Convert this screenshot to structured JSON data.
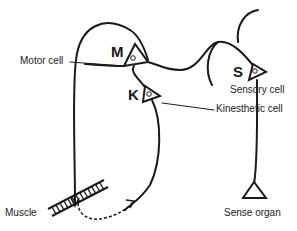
{
  "diagram": {
    "cells": {
      "motor": {
        "letter": "M",
        "label": "Motor cell"
      },
      "kinesthetic": {
        "letter": "K",
        "label": "Kinesthetic cell"
      },
      "sensory": {
        "letter": "S",
        "label": "Sensory cell"
      }
    },
    "organs": {
      "muscle": {
        "label": "Muscle"
      },
      "sense_organ": {
        "label": "Sense organ"
      }
    },
    "colors": {
      "ink": "#1a1a1a",
      "background": "#ffffff"
    }
  }
}
